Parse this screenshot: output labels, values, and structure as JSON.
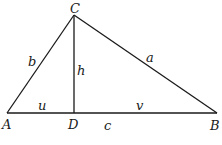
{
  "figure": {
    "type": "triangle-with-altitude",
    "vertices": {
      "A": {
        "label": "A",
        "x": 7,
        "y": 113
      },
      "B": {
        "label": "B",
        "x": 217,
        "y": 113
      },
      "C": {
        "label": "C",
        "x": 74,
        "y": 15
      },
      "D": {
        "label": "D",
        "x": 74,
        "y": 113
      }
    },
    "sides": {
      "a": "a",
      "b": "b",
      "c": "c",
      "h": "h",
      "u": "u",
      "v": "v"
    },
    "stroke_color": "#1a1a1a",
    "background": "#ffffff"
  }
}
